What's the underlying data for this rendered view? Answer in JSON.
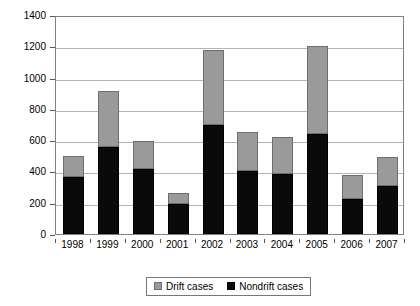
{
  "chart_data": {
    "type": "bar",
    "subtype": "stacked-bar",
    "title": "",
    "xlabel": "",
    "ylabel": "",
    "categories": [
      "1998",
      "1999",
      "2000",
      "2001",
      "2002",
      "2003",
      "2004",
      "2005",
      "2006",
      "2007"
    ],
    "series": [
      {
        "name": "Nondrift cases",
        "color": "#000000",
        "values": [
          365,
          555,
          415,
          195,
          700,
          405,
          385,
          640,
          225,
          310
        ]
      },
      {
        "name": "Drift cases",
        "color": "#9a9a9a",
        "values": [
          135,
          360,
          180,
          70,
          475,
          250,
          235,
          560,
          155,
          185
        ]
      }
    ],
    "totals": [
      500,
      915,
      595,
      265,
      1175,
      655,
      620,
      1200,
      380,
      495
    ],
    "ylim": [
      0,
      1400
    ],
    "ytick_step": 200,
    "yticks": [
      "0",
      "200",
      "400",
      "600",
      "800",
      "1000",
      "1200",
      "1400"
    ],
    "grid": true,
    "grid_axis": "y",
    "legend_position": "bottom-center",
    "legend": [
      {
        "label": "Drift cases",
        "swatch": "drift-swatch"
      },
      {
        "label": "Nondrift cases",
        "swatch": "nondrift-swatch"
      }
    ]
  }
}
